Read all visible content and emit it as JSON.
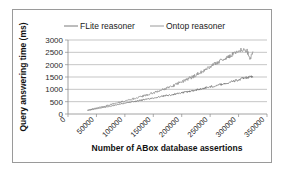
{
  "chart_data": {
    "type": "line",
    "title": "",
    "xlabel": "Number of ABox database assertions",
    "ylabel": "Query answering time (ms)",
    "xlim": [
      0,
      350000
    ],
    "ylim": [
      0,
      3000
    ],
    "ytick_labels": [
      "0",
      "500",
      "1000",
      "1500",
      "2000",
      "2500",
      "3000"
    ],
    "ytick_values": [
      0,
      500,
      1000,
      1500,
      2000,
      2500,
      3000
    ],
    "xtick_labels": [
      "0",
      "50000",
      "100000",
      "150000",
      "200000",
      "250000",
      "300000",
      "350000"
    ],
    "xtick_values": [
      0,
      50000,
      100000,
      150000,
      200000,
      250000,
      300000,
      350000
    ],
    "grid": "horizontal",
    "legend_position": "top",
    "legend_entries": [
      "FLite reasoner",
      "Ontop reasoner"
    ],
    "series": [
      {
        "name": "FLite reasoner",
        "color": "#6b6b6b",
        "x": [
          35000,
          40000,
          45000,
          50000,
          55000,
          60000,
          65000,
          70000,
          75000,
          80000,
          85000,
          90000,
          95000,
          100000,
          105000,
          110000,
          115000,
          120000,
          125000,
          130000,
          135000,
          140000,
          145000,
          150000,
          155000,
          160000,
          165000,
          170000,
          175000,
          180000,
          185000,
          190000,
          195000,
          200000,
          205000,
          210000,
          215000,
          220000,
          225000,
          230000,
          235000,
          240000,
          245000,
          250000,
          255000,
          260000,
          265000,
          270000,
          275000,
          280000,
          285000,
          290000,
          295000,
          300000,
          305000,
          310000,
          315000,
          320000,
          325000
        ],
        "y": [
          150,
          170,
          195,
          215,
          235,
          255,
          280,
          300,
          325,
          345,
          370,
          395,
          415,
          440,
          455,
          480,
          505,
          520,
          545,
          565,
          590,
          605,
          630,
          650,
          670,
          695,
          710,
          735,
          755,
          775,
          790,
          815,
          840,
          860,
          880,
          905,
          925,
          950,
          975,
          1000,
          1020,
          1050,
          1080,
          1100,
          1130,
          1150,
          1180,
          1205,
          1230,
          1260,
          1290,
          1320,
          1350,
          1380,
          1420,
          1450,
          1480,
          1500,
          1510
        ]
      },
      {
        "name": "Ontop reasoner",
        "color": "#8e8e8e",
        "x": [
          35000,
          40000,
          45000,
          50000,
          55000,
          60000,
          65000,
          70000,
          75000,
          80000,
          85000,
          90000,
          95000,
          100000,
          105000,
          110000,
          115000,
          120000,
          125000,
          130000,
          135000,
          140000,
          145000,
          150000,
          155000,
          160000,
          165000,
          170000,
          175000,
          180000,
          185000,
          190000,
          195000,
          200000,
          205000,
          210000,
          215000,
          220000,
          225000,
          230000,
          235000,
          240000,
          245000,
          250000,
          255000,
          260000,
          265000,
          270000,
          275000,
          280000,
          285000,
          290000,
          295000,
          300000,
          305000,
          310000,
          315000,
          320000,
          325000
        ],
        "y": [
          160,
          185,
          210,
          240,
          265,
          295,
          320,
          350,
          380,
          410,
          440,
          470,
          500,
          530,
          560,
          590,
          620,
          650,
          685,
          715,
          745,
          780,
          815,
          850,
          890,
          930,
          975,
          1020,
          1060,
          1105,
          1150,
          1200,
          1250,
          1300,
          1355,
          1410,
          1460,
          1520,
          1580,
          1640,
          1700,
          1770,
          1840,
          1910,
          1990,
          2060,
          2120,
          2180,
          2230,
          2290,
          2350,
          2430,
          2510,
          2580,
          2600,
          2590,
          2570,
          2180,
          2520
        ]
      }
    ],
    "annotations": {
      "flite_plateau_ms": 1500,
      "ontop_peak_ms": 2600,
      "ontop_final_drop_ms": 2180
    }
  },
  "colors": {
    "grid": "#9f9f9f",
    "axis": "#8a8a8a",
    "frame": "#9a9a9a",
    "text": "#2b2b2b",
    "series_flite": "#6b6b6b",
    "series_ontop": "#8e8e8e",
    "background": "#ffffff"
  }
}
